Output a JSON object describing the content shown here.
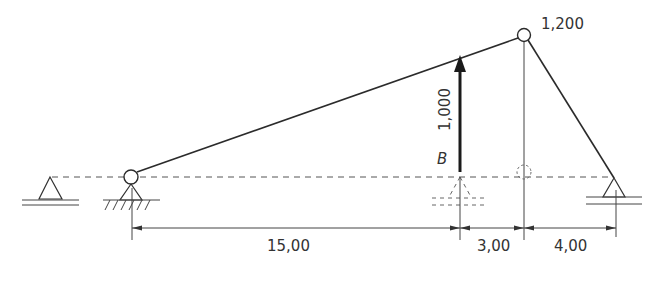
{
  "diagram": {
    "load": {
      "label": "1,000",
      "point_label": "B"
    },
    "apex_label": "1,200",
    "dimensions": [
      {
        "id": "span-1",
        "label": "15,00"
      },
      {
        "id": "span-2",
        "label": "3,00"
      },
      {
        "id": "span-3",
        "label": "4,00"
      }
    ],
    "colors": {
      "line": "#2b2b2b",
      "text": "#333333"
    }
  }
}
